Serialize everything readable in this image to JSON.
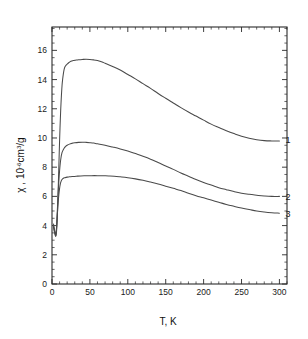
{
  "chart_data": {
    "type": "line",
    "title": "",
    "xlabel": "T, K",
    "ylabel": "χ , 10",
    "ylabel_exponent": "-6",
    "ylabel_units": "cm",
    "ylabel_units_exponent": "3",
    "ylabel_units_tail": "/g",
    "xlim": [
      0,
      310
    ],
    "ylim": [
      0,
      17.6
    ],
    "xticks": [
      0,
      50,
      100,
      150,
      200,
      250,
      300
    ],
    "yticks": [
      0,
      2,
      4,
      6,
      8,
      10,
      12,
      14,
      16
    ],
    "xtick_labels": [
      "0",
      "50",
      "100",
      "150",
      "200",
      "250",
      "300"
    ],
    "ytick_labels": [
      "0",
      "2",
      "4",
      "6",
      "8",
      "10",
      "12",
      "14",
      "16"
    ],
    "x_minor_interval": 10,
    "y_minor_interval": 0.5,
    "grid": false,
    "legend_position": "inline-right",
    "frame": "box",
    "ticks_direction": "in",
    "series": [
      {
        "name": "1",
        "label": "1",
        "label_x": 300,
        "label_y": 9.9,
        "x": [
          2,
          3,
          4,
          5,
          6,
          7,
          8,
          9,
          10,
          11,
          12,
          13,
          14,
          16,
          18,
          20,
          22,
          25,
          28,
          31,
          35,
          40,
          45,
          50,
          55,
          60,
          65,
          70,
          80,
          90,
          100,
          110,
          120,
          130,
          140,
          150,
          160,
          170,
          180,
          190,
          200,
          210,
          220,
          230,
          240,
          250,
          260,
          270,
          280,
          290,
          300
        ],
        "y": [
          4.1,
          3.8,
          3.5,
          3.3,
          3.6,
          4.6,
          6.2,
          8.0,
          9.8,
          11.3,
          12.5,
          13.4,
          14.0,
          14.7,
          14.95,
          15.05,
          15.15,
          15.25,
          15.3,
          15.33,
          15.36,
          15.38,
          15.39,
          15.38,
          15.35,
          15.3,
          15.22,
          15.12,
          14.9,
          14.65,
          14.35,
          14.05,
          13.72,
          13.4,
          13.05,
          12.72,
          12.4,
          12.08,
          11.78,
          11.5,
          11.22,
          10.95,
          10.72,
          10.5,
          10.3,
          10.12,
          9.98,
          9.88,
          9.82,
          9.8,
          9.8
        ]
      },
      {
        "name": "2",
        "label": "2",
        "label_x": 300,
        "label_y": 6.05,
        "x": [
          2,
          3,
          4,
          5,
          6,
          7,
          8,
          9,
          10,
          11,
          12,
          13,
          14,
          16,
          18,
          20,
          23,
          26,
          30,
          35,
          40,
          45,
          50,
          55,
          60,
          70,
          80,
          90,
          100,
          110,
          120,
          130,
          140,
          150,
          160,
          170,
          180,
          190,
          200,
          210,
          220,
          230,
          240,
          250,
          260,
          270,
          280,
          290,
          300
        ],
        "y": [
          4.0,
          3.7,
          3.5,
          3.4,
          3.9,
          5.0,
          6.1,
          7.0,
          7.75,
          8.3,
          8.7,
          8.95,
          9.1,
          9.3,
          9.42,
          9.5,
          9.58,
          9.63,
          9.67,
          9.7,
          9.71,
          9.7,
          9.68,
          9.65,
          9.6,
          9.5,
          9.38,
          9.25,
          9.1,
          8.93,
          8.75,
          8.55,
          8.32,
          8.08,
          7.85,
          7.6,
          7.38,
          7.15,
          6.95,
          6.78,
          6.6,
          6.46,
          6.33,
          6.22,
          6.14,
          6.08,
          6.03,
          6.0,
          6.0
        ]
      },
      {
        "name": "3",
        "label": "3",
        "label_x": 300,
        "label_y": 4.85,
        "x": [
          2,
          3,
          4,
          5,
          6,
          7,
          8,
          9,
          10,
          11,
          12,
          13,
          15,
          17,
          20,
          23,
          27,
          32,
          38,
          45,
          52,
          60,
          68,
          75,
          82,
          90,
          100,
          110,
          120,
          130,
          140,
          150,
          160,
          170,
          180,
          190,
          200,
          210,
          220,
          230,
          240,
          250,
          260,
          270,
          280,
          290,
          300
        ],
        "y": [
          3.9,
          3.6,
          3.4,
          3.3,
          3.8,
          4.7,
          5.5,
          6.1,
          6.55,
          6.85,
          7.03,
          7.14,
          7.24,
          7.28,
          7.32,
          7.34,
          7.36,
          7.38,
          7.4,
          7.41,
          7.42,
          7.42,
          7.41,
          7.4,
          7.38,
          7.34,
          7.28,
          7.2,
          7.1,
          6.98,
          6.85,
          6.7,
          6.55,
          6.4,
          6.22,
          6.05,
          5.9,
          5.75,
          5.6,
          5.45,
          5.32,
          5.2,
          5.1,
          5.0,
          4.93,
          4.88,
          4.85
        ]
      }
    ]
  },
  "labels": {
    "x_axis_title": "T, K",
    "y_axis_prefix": "χ , 10",
    "y_axis_exp": "-6",
    "y_axis_unit": "cm",
    "y_axis_unit_exp": "3",
    "y_axis_unit_tail": "/g"
  }
}
